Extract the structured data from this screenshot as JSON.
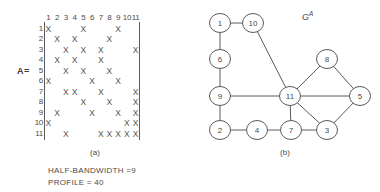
{
  "figure": {
    "matrix_label": "A=",
    "caption_a": "(a)",
    "caption_b": "(b)",
    "graph_label": "G",
    "graph_label_sup": "A",
    "stats": {
      "half_bandwidth": "HALF-BANDWIDTH =9",
      "profile": "PROFILE = 40"
    }
  },
  "matrix": {
    "size": 11,
    "symbol": "X",
    "column_headers": [
      "1",
      "2",
      "3",
      "4",
      "5",
      "6",
      "7",
      "8",
      "9",
      "10",
      "11"
    ],
    "row_headers": [
      "1",
      "2",
      "3",
      "4",
      "5",
      "6",
      "7",
      "8",
      "9",
      "10",
      "11"
    ],
    "entries": [
      [
        1,
        1
      ],
      [
        1,
        5
      ],
      [
        1,
        9
      ],
      [
        2,
        2
      ],
      [
        2,
        4
      ],
      [
        2,
        8
      ],
      [
        3,
        3
      ],
      [
        3,
        5
      ],
      [
        3,
        7
      ],
      [
        3,
        11
      ],
      [
        4,
        2
      ],
      [
        4,
        4
      ],
      [
        4,
        7
      ],
      [
        5,
        3
      ],
      [
        5,
        5
      ],
      [
        5,
        8
      ],
      [
        6,
        1
      ],
      [
        6,
        6
      ],
      [
        6,
        9
      ],
      [
        7,
        3
      ],
      [
        7,
        4
      ],
      [
        7,
        7
      ],
      [
        7,
        11
      ],
      [
        8,
        5
      ],
      [
        8,
        8
      ],
      [
        8,
        11
      ],
      [
        9,
        2
      ],
      [
        9,
        6
      ],
      [
        9,
        9
      ],
      [
        9,
        11
      ],
      [
        10,
        1
      ],
      [
        10,
        10
      ],
      [
        10,
        11
      ],
      [
        11,
        3
      ],
      [
        11,
        7
      ],
      [
        11,
        8
      ],
      [
        11,
        9
      ],
      [
        11,
        10
      ],
      [
        11,
        11
      ]
    ]
  },
  "chart_data": {
    "type": "diagram",
    "panels": [
      {
        "id": "a",
        "caption": "(a)",
        "type": "matrix-sparsity",
        "rows": 11,
        "cols": 11,
        "nonzeros": [
          [
            1,
            1
          ],
          [
            1,
            5
          ],
          [
            1,
            9
          ],
          [
            2,
            2
          ],
          [
            2,
            4
          ],
          [
            2,
            8
          ],
          [
            3,
            3
          ],
          [
            3,
            5
          ],
          [
            3,
            7
          ],
          [
            3,
            11
          ],
          [
            4,
            2
          ],
          [
            4,
            4
          ],
          [
            4,
            7
          ],
          [
            5,
            3
          ],
          [
            5,
            5
          ],
          [
            5,
            8
          ],
          [
            6,
            1
          ],
          [
            6,
            6
          ],
          [
            6,
            9
          ],
          [
            7,
            3
          ],
          [
            7,
            4
          ],
          [
            7,
            7
          ],
          [
            7,
            11
          ],
          [
            8,
            5
          ],
          [
            8,
            8
          ],
          [
            8,
            11
          ],
          [
            9,
            2
          ],
          [
            9,
            6
          ],
          [
            9,
            9
          ],
          [
            9,
            11
          ],
          [
            10,
            1
          ],
          [
            10,
            10
          ],
          [
            10,
            11
          ],
          [
            11,
            3
          ],
          [
            11,
            7
          ],
          [
            11,
            8
          ],
          [
            11,
            9
          ],
          [
            11,
            10
          ],
          [
            11,
            11
          ]
        ],
        "annotations": [
          "HALF-BANDWIDTH =9",
          "PROFILE = 40"
        ]
      },
      {
        "id": "b",
        "caption": "(b)",
        "type": "graph",
        "label": "G^A",
        "nodes": [
          {
            "id": "1",
            "x": 30,
            "y": 23
          },
          {
            "id": "10",
            "x": 63,
            "y": 23
          },
          {
            "id": "6",
            "x": 30,
            "y": 59
          },
          {
            "id": "9",
            "x": 30,
            "y": 96
          },
          {
            "id": "2",
            "x": 30,
            "y": 130
          },
          {
            "id": "4",
            "x": 67,
            "y": 130
          },
          {
            "id": "7",
            "x": 101,
            "y": 130
          },
          {
            "id": "11",
            "x": 100,
            "y": 96
          },
          {
            "id": "3",
            "x": 137,
            "y": 130
          },
          {
            "id": "5",
            "x": 170,
            "y": 96
          },
          {
            "id": "8",
            "x": 137,
            "y": 59
          }
        ],
        "edges": [
          [
            "1",
            "10"
          ],
          [
            "1",
            "6"
          ],
          [
            "6",
            "9"
          ],
          [
            "9",
            "2"
          ],
          [
            "2",
            "4"
          ],
          [
            "4",
            "7"
          ],
          [
            "7",
            "3"
          ],
          [
            "3",
            "5"
          ],
          [
            "5",
            "8"
          ],
          [
            "8",
            "11"
          ],
          [
            "11",
            "5"
          ],
          [
            "11",
            "3"
          ],
          [
            "11",
            "7"
          ],
          [
            "11",
            "9"
          ],
          [
            "10",
            "11"
          ]
        ]
      }
    ]
  }
}
